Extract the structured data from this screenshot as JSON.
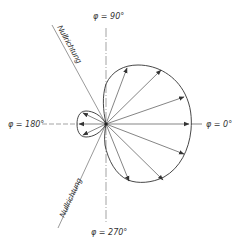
{
  "diagram": {
    "type": "polar radiation pattern (cardioid-like directional characteristic)",
    "labels": {
      "phi_90": "φ = 90°",
      "phi_0": "φ = 0°",
      "phi_180": "φ = 180°",
      "phi_270": "φ = 270°",
      "null_upper": "Nullrichtung",
      "null_lower": "Nullrichtung"
    },
    "colors": {
      "line": "#333333",
      "axis": "#555555",
      "background": "#ffffff"
    },
    "main_lobe": {
      "direction": "φ = 0°",
      "arrow_count": 7
    },
    "back_lobe": {
      "direction": "φ = 180°",
      "arrow_count": 3
    }
  }
}
